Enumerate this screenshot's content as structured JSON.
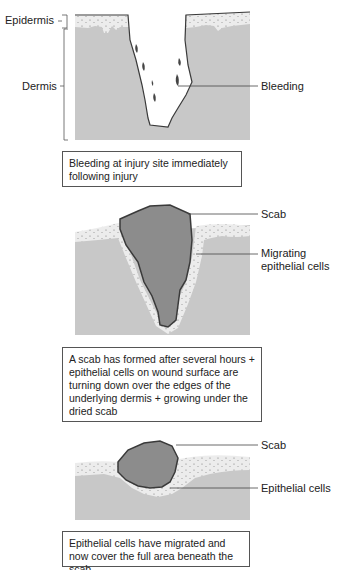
{
  "colors": {
    "dermis": "#c8c8c8",
    "epidermis": "#ececec",
    "scab": "#8c8c8c",
    "outline": "#3a3a3a",
    "leader": "#444444"
  },
  "panels": [
    {
      "labels": {
        "epidermis": "Epidermis",
        "dermis": "Dermis",
        "bleeding": "Bleeding"
      },
      "caption": "Bleeding at injury site immediately following injury"
    },
    {
      "labels": {
        "scab": "Scab",
        "migrating": "Migrating epithelial cells"
      },
      "caption": "A scab has formed after several hours + epithelial cells on wound surface are turning down over the edges of the underlying dermis + growing under the dried scab"
    },
    {
      "labels": {
        "scab": "Scab",
        "epithelial": "Epithelial cells"
      },
      "caption": "Epithelial cells have migrated and now cover the full area beneath the scab"
    }
  ]
}
